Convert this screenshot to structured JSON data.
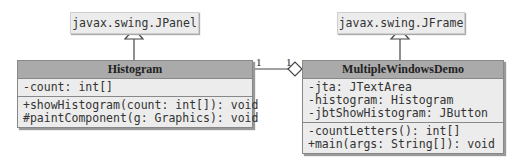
{
  "superclasses": {
    "left": "javax.swing.JPanel",
    "right": "javax.swing.JFrame"
  },
  "histogram": {
    "name": "Histogram",
    "fields": [
      "-count: int[]"
    ],
    "methods": [
      "+showHistogram(count: int[]): void",
      "#paintComponent(g: Graphics): void"
    ]
  },
  "mwd": {
    "name": "MultipleWindowsDemo",
    "fields": [
      "-jta: JTextArea",
      "-histogram: Histogram",
      "-jbtShowHistogram: JButton"
    ],
    "methods": [
      "-countLetters(): int[]",
      "+main(args: String[]): void"
    ]
  },
  "association": {
    "left_mult": "1",
    "right_mult": "1"
  }
}
